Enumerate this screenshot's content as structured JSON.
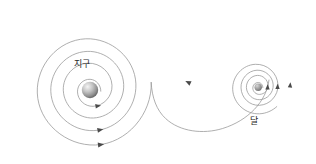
{
  "canvas": {
    "width": 316,
    "height": 164,
    "background_color": "#ffffff"
  },
  "figure": {
    "type": "orbital-spiral-diagram",
    "stroke_color": "#9a9a9a",
    "arrow_color": "#4a4a4a",
    "label_color": "#2a2a2a"
  },
  "labels": {
    "earth": "지구",
    "moon": "달"
  },
  "bodies": {
    "earth": {
      "label": "지구",
      "center_x": 90,
      "center_y": 90,
      "radius": 8,
      "fill_light": "#f2f2f2",
      "fill_mid": "#b8b8b8",
      "fill_dark": "#6b6b6b"
    },
    "moon": {
      "label": "달",
      "center_x": 258,
      "center_y": 87,
      "radius": 3.6,
      "fill_light": "#c9c9c9",
      "fill_mid": "#9a9a9a",
      "fill_dark": "#707070"
    }
  },
  "spirals": {
    "earth_spiral": {
      "name": "earth-spiral",
      "turns": 3,
      "center_x": 90,
      "center_y": 90,
      "start_radius": 11,
      "end_radius": 74,
      "direction": "counterclockwise-outward"
    },
    "moon_spiral": {
      "name": "moon-spiral",
      "turns": 2.4,
      "center_x": 258,
      "center_y": 87,
      "start_radius": 5,
      "end_radius": 36,
      "direction": "counterclockwise-outward"
    },
    "connector": {
      "name": "connector-curve",
      "description": "s-curve joining earth spiral to moon spiral"
    }
  },
  "arrows": [
    {
      "name": "earth-arrow-inner",
      "x": 97,
      "y": 103,
      "angle": 20
    },
    {
      "name": "earth-arrow-middle",
      "x": 100,
      "y": 127,
      "angle": 12
    },
    {
      "name": "earth-arrow-outer",
      "x": 100,
      "y": 152,
      "angle": 8
    },
    {
      "name": "connector-arrow",
      "x": 190,
      "y": 83,
      "angle": 128
    },
    {
      "name": "moon-arrow-inner",
      "x": 270,
      "y": 88,
      "angle": -84
    },
    {
      "name": "moon-arrow-middle",
      "x": 283,
      "y": 88,
      "angle": -84
    },
    {
      "name": "moon-arrow-outer",
      "x": 295,
      "y": 86,
      "angle": -84
    }
  ]
}
